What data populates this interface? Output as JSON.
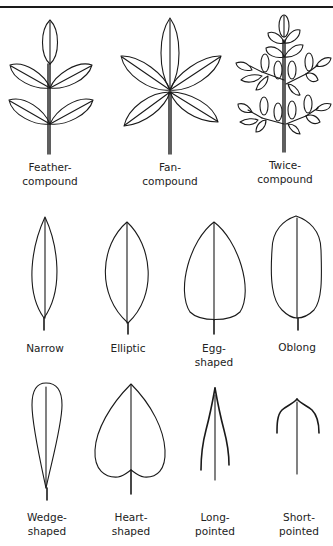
{
  "page": {
    "sections": [
      {
        "name": "compound-leaves",
        "items": [
          {
            "id": "feather-compound",
            "label_line1": "Feather-",
            "label_line2": "compound"
          },
          {
            "id": "fan-compound",
            "label_line1": "Fan-",
            "label_line2": "compound"
          },
          {
            "id": "twice-compound",
            "label_line1": "Twice-",
            "label_line2": "compound"
          }
        ]
      },
      {
        "name": "simple-leaves-row1",
        "items": [
          {
            "id": "narrow",
            "label_line1": "Narrow",
            "label_line2": ""
          },
          {
            "id": "elliptic",
            "label_line1": "Elliptic",
            "label_line2": ""
          },
          {
            "id": "egg-shaped",
            "label_line1": "Egg-",
            "label_line2": "shaped"
          },
          {
            "id": "oblong",
            "label_line1": "Oblong",
            "label_line2": ""
          }
        ]
      },
      {
        "name": "simple-leaves-row2",
        "items": [
          {
            "id": "wedge-shaped",
            "label_line1": "Wedge-",
            "label_line2": "shaped"
          },
          {
            "id": "heart-shaped",
            "label_line1": "Heart-",
            "label_line2": "shaped"
          },
          {
            "id": "long-pointed",
            "label_line1": "Long-",
            "label_line2": "pointed"
          },
          {
            "id": "short-pointed",
            "label_line1": "Short-",
            "label_line2": "pointed"
          }
        ]
      }
    ]
  }
}
